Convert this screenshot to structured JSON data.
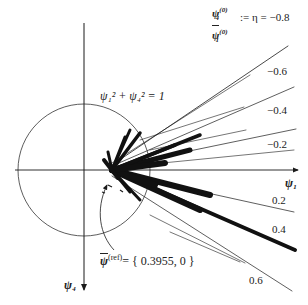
{
  "figure": {
    "eta_label": {
      "numerator": "ψ",
      "numerator_sub": "4",
      "numerator_sup": "(0)",
      "denominator": "ψ",
      "denominator_sub": "1",
      "denominator_sup": "(0)",
      "definition": ":= η = −0.8"
    },
    "ray_labels": [
      "−0.6",
      "−0.4",
      "−0.2",
      "0.2",
      "0.4",
      "0.6"
    ],
    "circle_equation": "ψ₁² + ψ₄² = 1",
    "axis_x_label": "ψ₁",
    "axis_y_label": "ψ₄",
    "reference_vector": {
      "symbol": "ψ",
      "superscript": "(ref)",
      "value": "= { 0.3955, 0 }"
    },
    "colors": {
      "ink": "#1a1a1a",
      "background": "#ffffff"
    }
  }
}
